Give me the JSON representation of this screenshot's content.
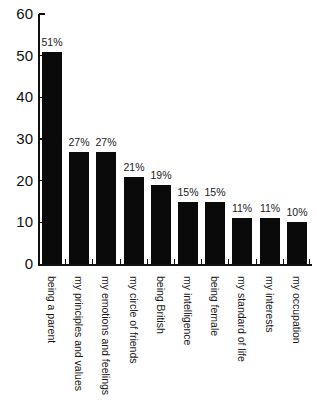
{
  "chart_data": {
    "type": "bar",
    "title": "",
    "xlabel": "",
    "ylabel": "",
    "categories": [
      "being a parent",
      "my principles and values",
      "my emotions and feelings",
      "my circle of friends",
      "being British",
      "my intelligence",
      "being female",
      "my standard of life",
      "my interests",
      "my occupation"
    ],
    "values": [
      51,
      27,
      27,
      21,
      19,
      15,
      15,
      11,
      11,
      10
    ],
    "value_labels": [
      "51%",
      "27%",
      "27%",
      "21%",
      "19%",
      "15%",
      "15%",
      "11%",
      "11%",
      "10%"
    ],
    "ylim": [
      0,
      60
    ],
    "yticks": [
      0,
      10,
      20,
      30,
      40,
      50,
      60
    ],
    "grid": false,
    "legend": null,
    "bar_color": "#0a0a0a",
    "axis_color": "#111111",
    "text_color": "#1a1a1a",
    "background_color": "#ffffff"
  }
}
